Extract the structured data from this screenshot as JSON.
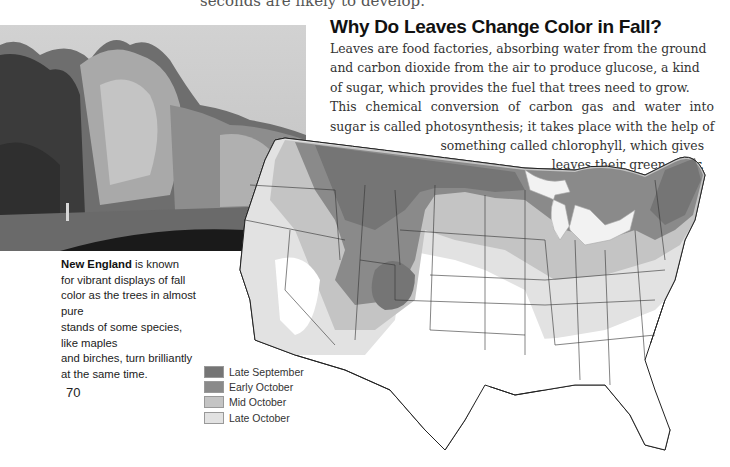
{
  "page": {
    "cutoff_text": "seconds are likely to develop.",
    "page_number": "70"
  },
  "article": {
    "title": "Why Do  Leaves Change Color in Fall?",
    "body_lines": [
      "Leaves are food factories, absorbing water from the ground",
      "and carbon dioxide from the air to produce glucose, a kind",
      "of sugar, which provides the fuel that trees need to grow.",
      "This chemical conversion of carbon gas and water into",
      "sugar is called photosynthesis; it takes place with the help of",
      "something called chlorophyll, which gives",
      "leaves their green color."
    ]
  },
  "caption": {
    "bold": "New England",
    "lines": [
      " is known",
      "for vibrant displays of fall",
      "color as the trees in almost pure",
      "stands of some species, like maples",
      "and birches, turn brilliantly",
      "at the same time."
    ]
  },
  "photo": {
    "subject": "forest-treeline-photo"
  },
  "map": {
    "subject": "us-fall-foliage-peak-map",
    "legend": [
      {
        "label": "Late September",
        "color": "#757575"
      },
      {
        "label": "Early October",
        "color": "#8a8a8a"
      },
      {
        "label": "Mid October",
        "color": "#c4c4c4"
      },
      {
        "label": "Late October",
        "color": "#e2e2e2"
      }
    ]
  }
}
